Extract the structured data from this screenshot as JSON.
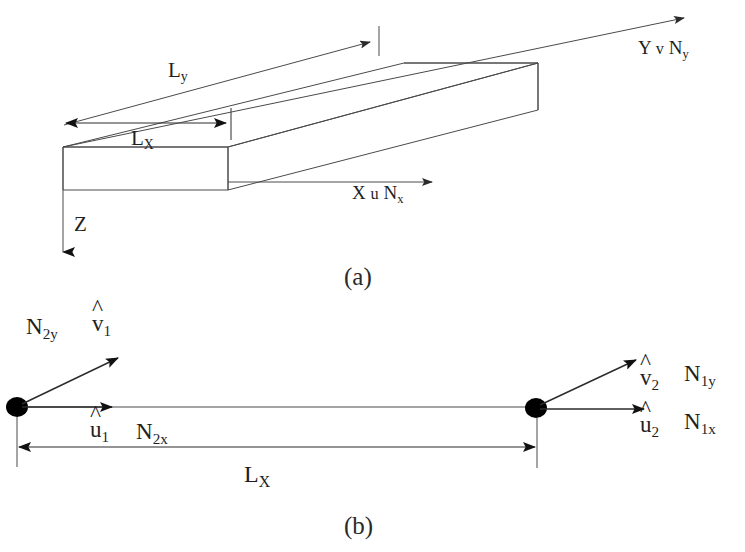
{
  "figure": {
    "background_color": "#ffffff",
    "line_color": "#3a3a3a",
    "text_color": "#1f1f1f",
    "node_color": "#000000"
  },
  "panel_a": {
    "caption": "(a)",
    "description": "Isometric view of a thin rectangular plate with global axes",
    "axes": [
      {
        "name": "x-axis",
        "letter": "X",
        "displacement": "u",
        "force": "N",
        "force_subscript": "x",
        "full_label": "X u Nx"
      },
      {
        "name": "y-axis",
        "letter": "Y",
        "displacement": "v",
        "force": "N",
        "force_subscript": "y",
        "full_label": "Y v Ny"
      },
      {
        "name": "z-axis",
        "letter": "Z",
        "displacement": "",
        "force": "",
        "force_subscript": "",
        "full_label": "Z"
      }
    ],
    "dimensions": [
      {
        "name": "length-y",
        "symbol": "L",
        "subscript": "y",
        "label": "Ly"
      },
      {
        "name": "length-x",
        "symbol": "L",
        "subscript": "X",
        "label": "LX"
      }
    ]
  },
  "panel_b": {
    "caption": "(b)",
    "description": "Two-node line element with nodal displacement and force components",
    "dimension": {
      "name": "element-length",
      "symbol": "L",
      "subscript": "X",
      "label": "LX"
    },
    "nodes": [
      {
        "id": "node-1",
        "position": "left",
        "labels": [
          {
            "name": "force-n2y",
            "symbol": "N",
            "subscript": "2y",
            "text": "N2y",
            "hat": false
          },
          {
            "name": "displacement-v1",
            "symbol": "v",
            "subscript": "1",
            "text": "v1",
            "hat": true
          },
          {
            "name": "displacement-u1",
            "symbol": "u",
            "subscript": "1",
            "text": "u1",
            "hat": true
          },
          {
            "name": "force-n2x",
            "symbol": "N",
            "subscript": "2x",
            "text": "N2x",
            "hat": false
          }
        ]
      },
      {
        "id": "node-2",
        "position": "right",
        "labels": [
          {
            "name": "displacement-v2",
            "symbol": "v",
            "subscript": "2",
            "text": "v2",
            "hat": true
          },
          {
            "name": "force-n1y",
            "symbol": "N",
            "subscript": "1y",
            "text": "N1y",
            "hat": false
          },
          {
            "name": "displacement-u2",
            "symbol": "u",
            "subscript": "2",
            "text": "u2",
            "hat": true
          },
          {
            "name": "force-n1x",
            "symbol": "N",
            "subscript": "1x",
            "text": "N1x",
            "hat": false
          }
        ]
      }
    ]
  },
  "symbols": {
    "hat": "^",
    "L": "L",
    "N": "N",
    "X": "X",
    "Y": "Y",
    "Z": "Z",
    "u": "u",
    "v": "v",
    "sub_x": "x",
    "sub_y": "y",
    "sub_X": "X",
    "sub_1": "1",
    "sub_2": "2",
    "sub_2y": "2y",
    "sub_2x": "2x",
    "sub_1y": "1y",
    "sub_1x": "1x"
  }
}
